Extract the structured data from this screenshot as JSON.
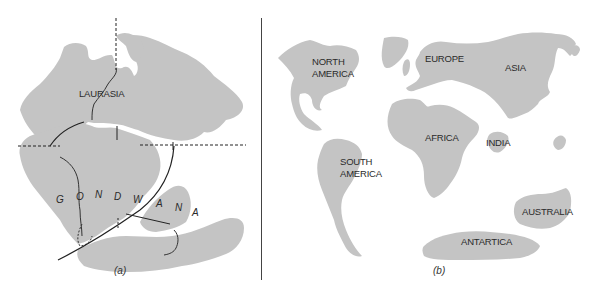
{
  "panel_a": {
    "title_label": "LAURASIA",
    "gondwana_letters": [
      "G",
      "O",
      "N",
      "D",
      "W",
      "A",
      "N",
      "A"
    ],
    "caption": "(a)"
  },
  "panel_b": {
    "continents": {
      "north_america_line1": "NORTH",
      "north_america_line2": "AMERICA",
      "europe": "EUROPE",
      "asia": "ASIA",
      "africa": "AFRICA",
      "india": "INDIA",
      "south_america_line1": "SOUTH",
      "south_america_line2": "AMERICA",
      "australia": "AUSTRALIA",
      "antarctica": "ANTARTICA"
    },
    "caption": "(b)"
  },
  "colors": {
    "land": "#c4c4c4",
    "lines": "#222222",
    "background": "#ffffff"
  }
}
